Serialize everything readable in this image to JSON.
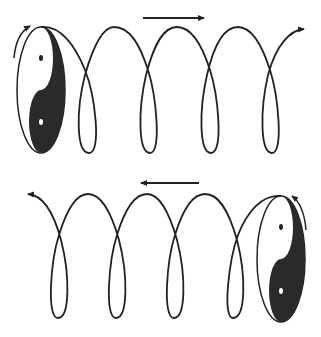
{
  "diagram": {
    "colors": {
      "stroke": "#222222",
      "fill_dark": "#2a2a2a",
      "background": "#ffffff"
    },
    "rows": [
      {
        "name": "top",
        "direction": "right",
        "yin_yang_position": "left",
        "loops": 4
      },
      {
        "name": "bottom",
        "direction": "left",
        "yin_yang_position": "right",
        "loops": 4
      }
    ]
  }
}
